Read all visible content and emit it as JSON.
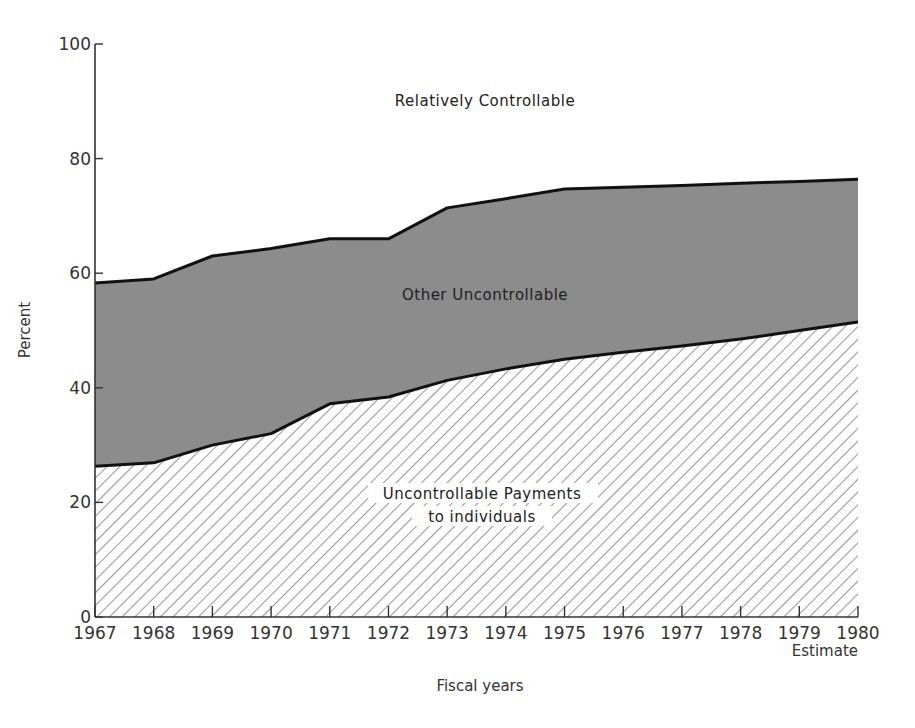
{
  "chart_data": {
    "type": "area",
    "stacked": true,
    "title": "",
    "xlabel": "Fiscal years",
    "ylabel": "Percent",
    "ylim": [
      0,
      100
    ],
    "yticks": [
      0,
      20,
      40,
      60,
      80,
      100
    ],
    "categories": [
      "1967",
      "1968",
      "1969",
      "1970",
      "1971",
      "1972",
      "1973",
      "1974",
      "1975",
      "1976",
      "1977",
      "1978",
      "1979",
      "1980"
    ],
    "x_note": "Estimate",
    "x_note_for": "1980",
    "grid": false,
    "series": [
      {
        "name": "Uncontrollable Payments to individuals",
        "label_lines": [
          "Uncontrollable Payments",
          "to individuals"
        ],
        "style": "hatched",
        "values": [
          26.3,
          26.9,
          30.0,
          32.0,
          37.2,
          38.4,
          41.3,
          43.3,
          45.0,
          46.2,
          47.3,
          48.5,
          50.0,
          51.5
        ]
      },
      {
        "name": "Other Uncontrollable",
        "label_lines": [
          "Other Uncontrollable"
        ],
        "style": "gray",
        "cumulative_top": [
          58.3,
          59.0,
          63.0,
          64.3,
          66.0,
          66.0,
          71.4,
          73.0,
          74.7,
          75.0,
          75.3,
          75.7,
          76.0,
          76.4
        ],
        "values": [
          32.0,
          32.1,
          33.0,
          32.3,
          28.8,
          27.6,
          30.1,
          29.7,
          29.7,
          28.8,
          28.0,
          27.2,
          26.0,
          24.9
        ]
      },
      {
        "name": "Relatively Controllable",
        "label_lines": [
          "Relatively Controllable"
        ],
        "style": "white",
        "values": [
          41.7,
          41.0,
          37.0,
          35.7,
          34.0,
          34.0,
          28.6,
          27.0,
          25.3,
          25.0,
          24.7,
          24.3,
          24.0,
          23.6
        ]
      }
    ],
    "colors": {
      "gray_fill": "#8c8c8c",
      "hatch_line": "#9a9a9a",
      "boundary_line": "#111111",
      "axis": "#333333"
    }
  }
}
